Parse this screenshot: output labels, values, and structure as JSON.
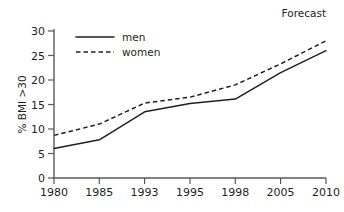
{
  "chart_data": {
    "type": "line",
    "title": "",
    "subtitle": "",
    "xlabel": "",
    "ylabel": "% BMI >30",
    "categories": [
      "1980",
      "1985",
      "1993",
      "1995",
      "1998",
      "2005",
      "2010"
    ],
    "series": [
      {
        "name": "men",
        "style": "solid",
        "color": "#231f20",
        "values": [
          6,
          7.8,
          13.5,
          15.2,
          16.1,
          21.5,
          26
        ]
      },
      {
        "name": "women",
        "style": "dashed",
        "color": "#231f20",
        "values": [
          8.7,
          11,
          15.3,
          16.5,
          19,
          23.3,
          28
        ]
      }
    ],
    "ylim": [
      0,
      30
    ],
    "y_ticks": [
      "0",
      "5",
      "10",
      "15",
      "20",
      "25",
      "30"
    ],
    "x_ticks": [
      "1980",
      "1985",
      "1993",
      "1995",
      "1998",
      "2005",
      "2010"
    ],
    "grid": false,
    "legend_position": "top-left-inside",
    "annotations": [
      {
        "text": "Forecast",
        "position": "top-right"
      }
    ]
  },
  "axes": {
    "y_title": "% BMI >30",
    "y_ticks": [
      "0",
      "5",
      "10",
      "15",
      "20",
      "25",
      "30"
    ],
    "x_ticks": [
      "1980",
      "1985",
      "1993",
      "1995",
      "1998",
      "2005",
      "2010"
    ]
  },
  "legend": {
    "entries": [
      {
        "label": "men",
        "style": "solid"
      },
      {
        "label": "women",
        "style": "dashed"
      }
    ]
  },
  "annotations": {
    "forecast": "Forecast"
  },
  "colors": {
    "background": "#ffffff",
    "ink": "#231f20",
    "axis": "#58595b"
  }
}
